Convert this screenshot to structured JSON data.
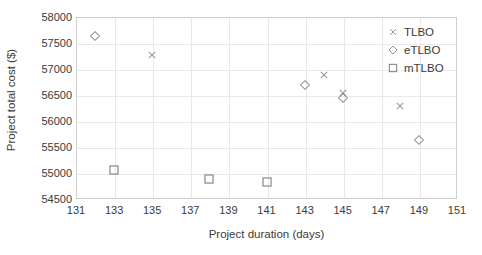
{
  "chart_data": {
    "type": "scatter",
    "title": "",
    "xlabel": "Project duration (days)",
    "ylabel": "Project total cost ($)",
    "xlim": [
      131,
      151
    ],
    "ylim": [
      54500,
      58000
    ],
    "xticks": [
      131,
      133,
      135,
      137,
      139,
      141,
      143,
      145,
      147,
      149,
      151
    ],
    "yticks": [
      54500,
      55000,
      55500,
      56000,
      56500,
      57000,
      57500,
      58000
    ],
    "grid": true,
    "legend_position": "top-right",
    "series": [
      {
        "name": "TLBO",
        "marker": "x-cross",
        "color": "#9a9a9a",
        "points": [
          {
            "x": 135,
            "y": 57260
          },
          {
            "x": 144,
            "y": 56890
          },
          {
            "x": 145,
            "y": 56530
          },
          {
            "x": 148,
            "y": 56290
          }
        ]
      },
      {
        "name": "eTLBO",
        "marker": "diamond-open",
        "color": "#8f8f8f",
        "points": [
          {
            "x": 132,
            "y": 57630
          },
          {
            "x": 143,
            "y": 56690
          },
          {
            "x": 145,
            "y": 56450
          },
          {
            "x": 149,
            "y": 55640
          }
        ]
      },
      {
        "name": "mTLBO",
        "marker": "square-open",
        "color": "#7d7d7d",
        "points": [
          {
            "x": 133,
            "y": 55060
          },
          {
            "x": 138,
            "y": 54890
          },
          {
            "x": 141,
            "y": 54820
          }
        ]
      }
    ]
  },
  "legend": {
    "items": [
      {
        "label": "TLBO",
        "marker": "x-cross"
      },
      {
        "label": "eTLBO",
        "marker": "diamond-open"
      },
      {
        "label": "mTLBO",
        "marker": "square-open"
      }
    ]
  },
  "colors": {
    "plot_border": "#cfcfcf",
    "gridline": "#e9e9e9",
    "text": "#3a3a3a",
    "background": "#ffffff"
  }
}
